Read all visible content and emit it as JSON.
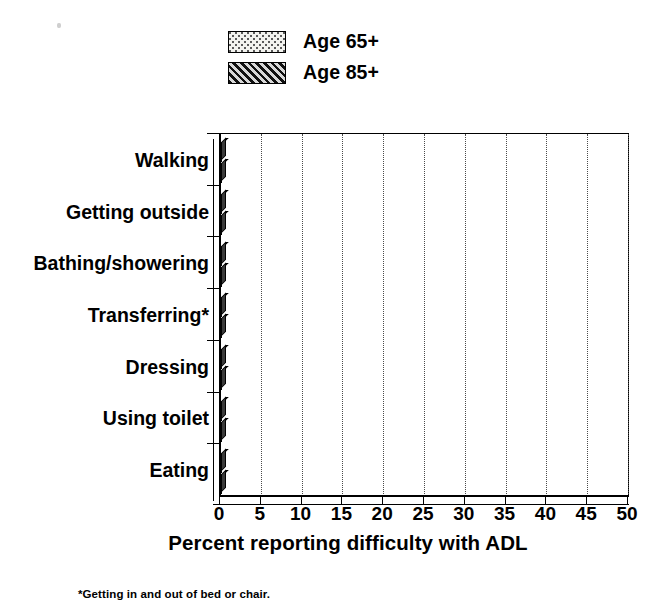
{
  "legend": {
    "position": "top-center",
    "entries": [
      {
        "label": "Age 65+",
        "pattern": "dotted-stipple",
        "series_key": "age65"
      },
      {
        "label": "Age 85+",
        "pattern": "diagonal-hatch",
        "series_key": "age85"
      }
    ]
  },
  "footnote": "*Getting in and out of bed or chair.",
  "colors": {
    "axis": "#000000",
    "gridline": "#4a4a4a",
    "age65_fill": "#f3f3ef",
    "age65_dots": "#5a5a5a",
    "age85_fill": "#6e6e6e",
    "age85_hatch": "#111111",
    "bar_shadow": "#2e2e2e"
  },
  "chart_data": {
    "type": "bar",
    "orientation": "horizontal",
    "title": "",
    "xlabel": "Percent reporting difficulty with ADL",
    "ylabel": "",
    "xlim": [
      0,
      50
    ],
    "xticks": [
      0,
      5,
      10,
      15,
      20,
      25,
      30,
      35,
      40,
      45,
      50
    ],
    "xtick_labels": [
      "0",
      "5",
      "10",
      "15",
      "20",
      "25",
      "30",
      "35",
      "40",
      "45",
      "50"
    ],
    "grid": true,
    "grid_axis": "x",
    "legend_position": "top-center",
    "categories": [
      "Walking",
      "Getting outside",
      "Bathing/showering",
      "Transferring*",
      "Dressing",
      "Using toilet",
      "Eating"
    ],
    "series": [
      {
        "name": "Age 65+",
        "values": [
          19.8,
          10.5,
          10.3,
          8.5,
          6.5,
          4.7,
          2.5
        ]
      },
      {
        "name": "Age 85+",
        "values": [
          40.4,
          31.5,
          28.6,
          20.3,
          17.5,
          14.6,
          4.5
        ]
      }
    ]
  }
}
